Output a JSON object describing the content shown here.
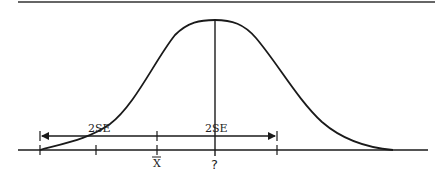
{
  "diagram": {
    "type": "normal-distribution-confidence-interval",
    "colors": {
      "line": "#1a1a1a",
      "background": "#ffffff"
    },
    "labels": {
      "left_interval": "2SE",
      "right_interval": "2SE",
      "sample_mean": "X",
      "population_mean": "?"
    },
    "axis": {
      "tick_count": 5,
      "marked_ticks": [
        "X̄",
        "?"
      ]
    }
  }
}
